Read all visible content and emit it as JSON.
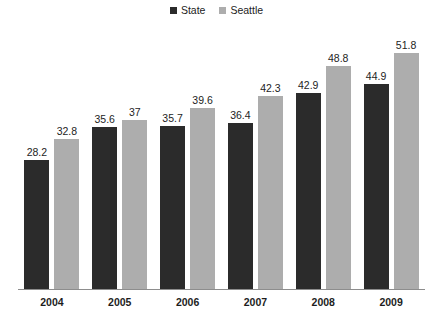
{
  "chart_data": {
    "type": "bar",
    "title": "",
    "subtitle": "",
    "xlabel": "",
    "ylabel": "",
    "categories": [
      "2004",
      "2005",
      "2006",
      "2007",
      "2008",
      "2009"
    ],
    "series": [
      {
        "name": "State",
        "color": "#2b2b2b",
        "values": [
          28.2,
          35.6,
          35.7,
          36.4,
          42.9,
          44.9
        ],
        "labels": [
          "28.2",
          "35.6",
          "35.7",
          "36.4",
          "42.9",
          "44.9"
        ]
      },
      {
        "name": "Seattle",
        "color": "#adadad",
        "values": [
          32.8,
          37,
          39.6,
          42.3,
          48.8,
          51.8
        ],
        "labels": [
          "32.8",
          "37",
          "39.6",
          "42.3",
          "48.8",
          "51.8"
        ]
      }
    ],
    "ylim": [
      0,
      55
    ],
    "grid": false,
    "legend_position": "top-center",
    "data_labels": true,
    "axis_color": "#8d8d8d"
  },
  "legend": {
    "entries": [
      {
        "label": "State",
        "color": "#2b2b2b"
      },
      {
        "label": "Seattle",
        "color": "#adadad"
      }
    ]
  }
}
